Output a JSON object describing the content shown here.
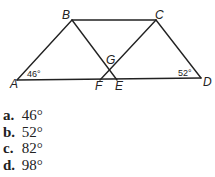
{
  "figure": {
    "points": {
      "A": {
        "label": "A",
        "x": 17,
        "y": 80
      },
      "B": {
        "label": "B",
        "x": 72,
        "y": 20
      },
      "C": {
        "label": "C",
        "x": 156,
        "y": 20
      },
      "D": {
        "label": "D",
        "x": 201,
        "y": 78
      },
      "E": {
        "label": "E",
        "x": 117,
        "y": 80
      },
      "F": {
        "label": "F",
        "x": 100,
        "y": 80
      },
      "G": {
        "label": "G",
        "x": 110,
        "y": 70
      }
    },
    "segments": [
      "AB",
      "BC",
      "CD",
      "AD",
      "BE",
      "CF"
    ],
    "angles": [
      {
        "vertex": "A",
        "label": "46°"
      },
      {
        "vertex": "D",
        "label": "52°"
      }
    ]
  },
  "choices": [
    {
      "letter": "a.",
      "value": "46°"
    },
    {
      "letter": "b.",
      "value": "52°"
    },
    {
      "letter": "c.",
      "value": "82°"
    },
    {
      "letter": "d.",
      "value": "98°"
    }
  ]
}
